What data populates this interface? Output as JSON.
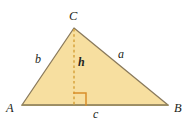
{
  "figure": {
    "type": "triangle-area-diagram",
    "background_color": "#ffffff",
    "fill_color": "#f7dfa0",
    "stroke_color": "#8a7a5c",
    "base_stroke_color": "#9c8e63",
    "dash_color": "#d8a43c",
    "right_angle_color": "#d98f2a",
    "label_color": "#231f20",
    "vertices": {
      "A": {
        "label": "A",
        "x": 22,
        "y": 105
      },
      "B": {
        "label": "B",
        "x": 168,
        "y": 105
      },
      "C": {
        "label": "C",
        "x": 74,
        "y": 28
      }
    },
    "labels": {
      "vertex_a": "A",
      "vertex_b": "B",
      "vertex_c": "C",
      "side_a": "a",
      "side_b": "b",
      "side_c": "c",
      "height": "h"
    },
    "altitude": {
      "from": "C",
      "foot_x": 74,
      "foot_y": 105,
      "style": "dashed"
    },
    "right_angle_marker": {
      "size": 12,
      "at_x": 74,
      "at_y": 105,
      "opens": "right"
    }
  }
}
